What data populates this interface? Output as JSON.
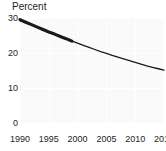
{
  "chart_data": {
    "type": "line",
    "title": "",
    "xlabel": "",
    "ylabel": "Percent",
    "ylim": [
      0,
      30
    ],
    "xlim": [
      1990,
      2015
    ],
    "yticks": [
      0,
      10,
      20,
      30
    ],
    "ytick_labels": [
      "0",
      "10",
      "20",
      "30"
    ],
    "xticks": [
      1990,
      1995,
      2000,
      2005,
      2010,
      2015
    ],
    "xtick_labels": [
      "1990",
      "1995",
      "2000",
      "2005",
      "2010",
      "2015"
    ],
    "grid": true,
    "grid_color": "#ffffff",
    "plot_background": "#fafafa",
    "legend": "none",
    "series": [
      {
        "name": "Percent",
        "line_color": "#1a1a1a",
        "x": [
          1990,
          1991,
          1992,
          1993,
          1994,
          1995,
          1996,
          1997,
          1998,
          1999,
          2000,
          2001,
          2002,
          2003,
          2004,
          2005,
          2006,
          2007,
          2008,
          2009,
          2010,
          2011,
          2012,
          2013,
          2014,
          2015
        ],
        "values": [
          29.5,
          28.8,
          28.1,
          27.4,
          26.7,
          26.0,
          25.4,
          24.7,
          24.1,
          23.4,
          22.8,
          22.2,
          21.6,
          21.0,
          20.4,
          19.9,
          19.3,
          18.8,
          18.3,
          17.8,
          17.3,
          16.8,
          16.3,
          15.9,
          15.5,
          15.1
        ],
        "segments": [
          {
            "kind": "observed",
            "x_start": 1990,
            "x_end": 1999,
            "line_width": 3.2
          },
          {
            "kind": "projected",
            "x_start": 1999,
            "x_end": 2015,
            "line_width": 1.3
          }
        ]
      }
    ],
    "annotations": []
  },
  "axis": {
    "y_title": "Percent"
  }
}
